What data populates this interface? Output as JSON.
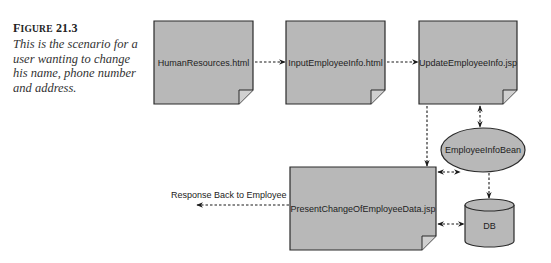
{
  "figure": {
    "label_prefix": "F",
    "label_rest": "IGURE",
    "number": "21.3",
    "caption": "This is the scenario for a user wanting to change his name, phone number and address."
  },
  "nodes": {
    "human_resources": {
      "label": "HumanResources.html",
      "shape": "document"
    },
    "input_employee_info": {
      "label": "InputEmployeeInfo.html",
      "shape": "document"
    },
    "update_employee_info": {
      "label": "UpdateEmployeeInfo.jsp",
      "shape": "document"
    },
    "employee_info_bean": {
      "label": "EmployeeInfoBean",
      "shape": "ellipse"
    },
    "present_change": {
      "label": "PresentChangeOfEmployeeData.jsp",
      "shape": "document"
    },
    "db": {
      "label": "DB",
      "shape": "cylinder"
    }
  },
  "edges": [
    {
      "from": "human_resources",
      "to": "input_employee_info",
      "style": "dashed",
      "direction": "forward"
    },
    {
      "from": "input_employee_info",
      "to": "update_employee_info",
      "style": "dashed",
      "direction": "forward"
    },
    {
      "from": "update_employee_info",
      "to": "employee_info_bean",
      "style": "dashed",
      "direction": "both"
    },
    {
      "from": "update_employee_info",
      "to": "present_change",
      "style": "dashed",
      "direction": "forward"
    },
    {
      "from": "employee_info_bean",
      "to": "present_change",
      "style": "dashed",
      "direction": "both"
    },
    {
      "from": "employee_info_bean",
      "to": "db",
      "style": "dashed",
      "direction": "forward"
    },
    {
      "from": "db",
      "to": "present_change",
      "style": "dashed",
      "direction": "both"
    },
    {
      "from": "present_change",
      "to": "outside",
      "style": "dashed",
      "direction": "forward",
      "label": "Response Back to Employee"
    }
  ],
  "response_label": "Response Back to Employee",
  "colors": {
    "shape_fill": "#b8b8b8",
    "stroke": "#2a2a2a",
    "text": "#222222"
  }
}
